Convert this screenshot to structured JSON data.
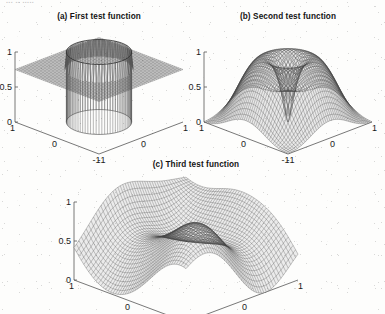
{
  "figure": {
    "background_color": "#fdfdfc",
    "ink_color": "#1a1a1a",
    "scan_header_fragment": "... .. ....."
  },
  "panels": [
    {
      "id": "panel-a",
      "title": "(a) First test function",
      "z_ticks": [
        "1",
        "0.5",
        "0"
      ],
      "left_axis_ticks": [
        "1",
        "0",
        "-1"
      ],
      "right_axis_ticks": [
        "-1",
        "0",
        "1"
      ]
    },
    {
      "id": "panel-b",
      "title": "(b) Second test function",
      "z_ticks": [
        "1",
        "0.5",
        "0"
      ],
      "left_axis_ticks": [
        "1",
        "0",
        "-1"
      ],
      "right_axis_ticks": [
        "-1",
        "0",
        "1"
      ]
    },
    {
      "id": "panel-c",
      "title": "(c) Third test function",
      "z_ticks": [
        "1",
        "0.5",
        "0"
      ],
      "left_axis_ticks": [
        "1",
        "0"
      ],
      "right_axis_ticks": [
        "0",
        "1"
      ]
    }
  ],
  "chart_data": [
    {
      "type": "surface",
      "id": "a",
      "title": "(a) First test function",
      "description": "Cylindrical plateau: flat base plane at z=0.75 with a raised circular disc of radius ~0.55 rising to z=1; vertical cylinder wall dropping to z=0 beneath the disc.",
      "xlabel": "",
      "ylabel": "",
      "zlabel": "",
      "xlim": [
        -1,
        1
      ],
      "ylim": [
        -1,
        1
      ],
      "zlim": [
        0,
        1
      ],
      "xticks": [
        -1,
        0,
        1
      ],
      "yticks": [
        -1,
        0,
        1
      ],
      "zticks": [
        0,
        0.5,
        1
      ],
      "grid": false,
      "mesh": "wireframe",
      "plateau_radius": 0.55,
      "base_level": 0.75,
      "top_level": 1.0,
      "floor_level": 0.0
    },
    {
      "type": "surface",
      "id": "b",
      "title": "(b) Second test function",
      "description": "Broad dome/mesa rising to z=1 at the centre with four steep valleys toward the corners, pierced by a narrow downward spike at the exact centre reaching z=0.",
      "xlabel": "",
      "ylabel": "",
      "zlabel": "",
      "xlim": [
        -1,
        1
      ],
      "ylim": [
        -1,
        1
      ],
      "zlim": [
        0,
        1
      ],
      "xticks": [
        -1,
        0,
        1
      ],
      "yticks": [
        -1,
        0,
        1
      ],
      "zticks": [
        0,
        0.5,
        1
      ],
      "grid": false,
      "mesh": "wireframe",
      "dome_peak": 1.0,
      "spike_depth": 0.0,
      "shelf_level": 0.6
    },
    {
      "type": "surface",
      "id": "c",
      "title": "(c) Third test function",
      "description": "Smooth undulating surface: a large rounded ridge reaching z=1 in the rear-right, a secondary lower swell near z=0.35 at the left, and a broad trough descending to z=0 in the foreground.",
      "xlabel": "",
      "ylabel": "",
      "zlabel": "",
      "xlim": [
        -1,
        1
      ],
      "ylim": [
        -1,
        1
      ],
      "zlim": [
        0,
        1
      ],
      "xticks": [
        0,
        1
      ],
      "yticks": [
        0,
        1
      ],
      "zticks": [
        0,
        0.5,
        1
      ],
      "grid": false,
      "mesh": "wireframe",
      "main_peak": 1.0,
      "secondary_peak": 0.38,
      "trough": 0.0
    }
  ]
}
